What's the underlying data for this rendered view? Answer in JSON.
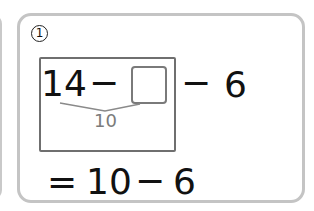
{
  "problem": {
    "number_label": "1",
    "expression": {
      "first_operand": "14",
      "operator_1": "−",
      "blank_value": "",
      "operator_2": "−",
      "second_operand": "6"
    },
    "decomposition": {
      "label": "10"
    },
    "result_line": {
      "equals": "=",
      "first": "10",
      "operator": "−",
      "second": "6"
    }
  },
  "colors": {
    "card_border": "#c4c4c4",
    "inner_box_border": "#6f6f6f",
    "answer_box_border": "#7a7a7a",
    "bracket_line": "#8a8a8a",
    "decomposition_text": "#7b7b7b",
    "text": "#111111"
  }
}
